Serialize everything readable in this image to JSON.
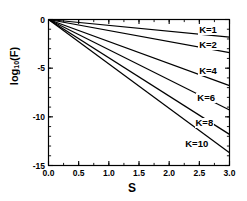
{
  "chart_data": {
    "type": "line",
    "title": "",
    "xlabel": "S",
    "ylabel": "log10(F)",
    "ylabel_base": "log",
    "ylabel_sub": "10",
    "ylabel_tail": "(F)",
    "xlim": [
      0.0,
      3.0
    ],
    "ylim": [
      -15,
      0
    ],
    "grid": false,
    "legend_position": "inline-right",
    "x_ticks": [
      "0.0",
      "0.5",
      "1.0",
      "1.5",
      "2.0",
      "2.5",
      "3.0"
    ],
    "x_tick_values": [
      0.0,
      0.5,
      1.0,
      1.5,
      2.0,
      2.5,
      3.0
    ],
    "x_minor_step": 0.25,
    "y_ticks": [
      "0",
      "-5",
      "-10",
      "-15"
    ],
    "y_tick_values": [
      0,
      -5,
      -10,
      -15
    ],
    "y_minor_step": 1,
    "x": [
      0.0,
      3.0
    ],
    "series": [
      {
        "name": "K=1",
        "label": "K=1",
        "values": [
          0.0,
          -1.8
        ],
        "slope": -0.6,
        "label_x": 2.48,
        "label_y": -1.05
      },
      {
        "name": "K=2",
        "label": "K=2",
        "values": [
          0.0,
          -3.4
        ],
        "slope": -1.133,
        "label_x": 2.48,
        "label_y": -2.65
      },
      {
        "name": "K=4",
        "label": "K=4",
        "values": [
          0.0,
          -6.8
        ],
        "slope": -2.267,
        "label_x": 2.48,
        "label_y": -5.25
      },
      {
        "name": "K=6",
        "label": "K=6",
        "values": [
          0.0,
          -9.3
        ],
        "slope": -3.1,
        "label_x": 2.45,
        "label_y": -8.05
      },
      {
        "name": "K=8",
        "label": "K=8",
        "values": [
          0.0,
          -11.8
        ],
        "slope": -3.933,
        "label_x": 2.42,
        "label_y": -10.6
      },
      {
        "name": "K=10",
        "label": "K=10",
        "values": [
          0.0,
          -13.7
        ],
        "slope": -4.567,
        "label_x": 2.25,
        "label_y": -12.8
      }
    ]
  },
  "colors": {
    "line": "#000000",
    "axis": "#000000",
    "background": "#ffffff"
  }
}
